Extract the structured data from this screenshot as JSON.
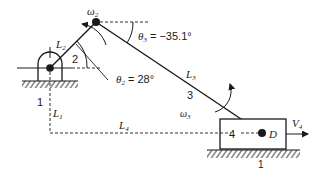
{
  "diagram": {
    "type": "slider-crank mechanism",
    "colors": {
      "ink": "#1a1a1a",
      "background": "#ffffff"
    },
    "links": [
      {
        "id": "1",
        "label": "1",
        "role": "ground"
      },
      {
        "id": "2",
        "label": "2",
        "length_label": "L",
        "length_sub": "2",
        "role": "crank"
      },
      {
        "id": "3",
        "label": "3",
        "length_label": "L",
        "length_sub": "3",
        "role": "connecting rod"
      },
      {
        "id": "4",
        "label": "4",
        "role": "slider"
      }
    ],
    "angles": {
      "theta2": {
        "symbol": "θ",
        "sub": "2",
        "value": " = 28°"
      },
      "theta3": {
        "symbol": "θ",
        "sub": "3",
        "value": " = −35.1°"
      }
    },
    "angular_velocities": {
      "omega2": {
        "symbol": "ω",
        "sub": "2"
      },
      "omega3": {
        "symbol": "ω",
        "sub": "3"
      }
    },
    "dimensions": {
      "L1": {
        "symbol": "L",
        "sub": "1"
      },
      "L4": {
        "symbol": "L",
        "sub": "4"
      }
    },
    "points": {
      "D": {
        "label": "D"
      }
    },
    "velocity": {
      "V4": {
        "symbol": "V",
        "sub": "4"
      }
    },
    "ground_labels": {
      "left": "1",
      "right": "1"
    }
  }
}
